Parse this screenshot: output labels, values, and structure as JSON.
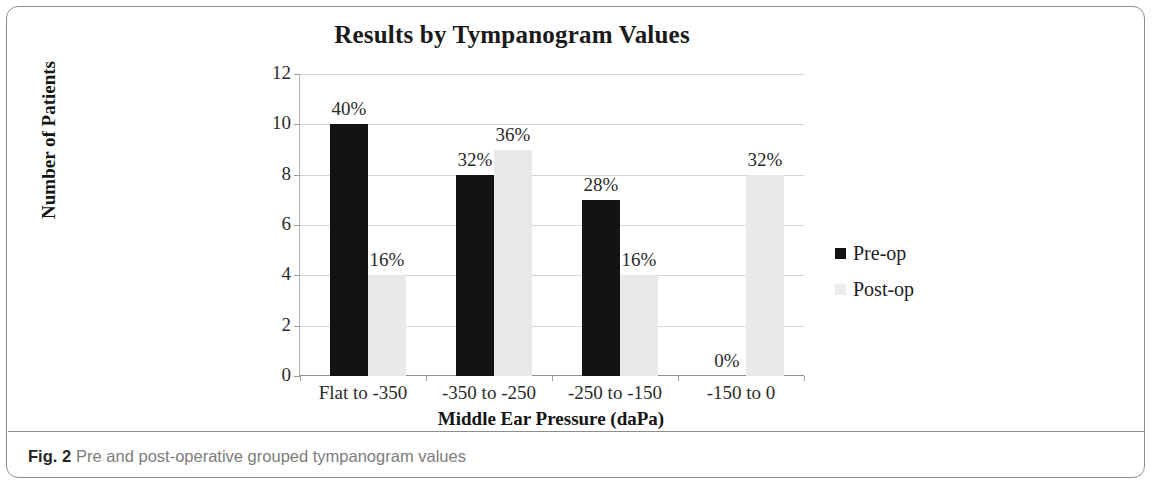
{
  "figure": {
    "caption_number": "Fig. 2",
    "caption_text": "Pre and post-operative grouped tympanogram values"
  },
  "chart_data": {
    "type": "bar",
    "title": "Results by Tympanogram Values",
    "xlabel": "Middle Ear Pressure (daPa)",
    "ylabel": "Number of Patients",
    "ylim": [
      0,
      12
    ],
    "yticks": [
      "0",
      "2",
      "4",
      "6",
      "8",
      "10",
      "12"
    ],
    "grid": true,
    "legend_position": "right",
    "categories": [
      "Flat to -350",
      "-350 to -250",
      "-250 to -150",
      "-150 to 0"
    ],
    "series": [
      {
        "name": "Pre-op",
        "color": "#131313",
        "values": [
          10,
          8,
          7,
          0
        ],
        "labels": [
          "40%",
          "32%",
          "28%",
          "0%"
        ]
      },
      {
        "name": "Post-op",
        "color": "#e9e9e9",
        "values": [
          4,
          9,
          4,
          8
        ],
        "labels": [
          "16%",
          "36%",
          "16%",
          "32%"
        ]
      }
    ]
  }
}
